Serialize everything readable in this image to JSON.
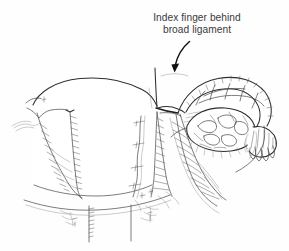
{
  "figure": {
    "title": "Index finger behind broad ligament",
    "background_color": "#fefefe",
    "ink_color": "#2e2e2e",
    "text_color": "#3b3b3b"
  },
  "callout": {
    "name": "index-finger-behind-broad-ligament",
    "line1": "Index finger behind",
    "line2": "broad ligament",
    "text_anchor_x": 197,
    "line1_y": 21,
    "line2_y": 33,
    "font_size_px": 10.2,
    "color": "#3b3b3b"
  },
  "arrow": {
    "name": "callout-arrow",
    "color": "#121212",
    "from_x": 188,
    "from_y": 41,
    "to_x": 174,
    "to_y": 70,
    "curved": true,
    "head": "filled-triangle-down"
  },
  "anatomy": {
    "labels_visible": false,
    "parts": [
      {
        "name": "uterus-body",
        "side": "center-left",
        "note": "smooth domed fundus and corpus"
      },
      {
        "name": "broad-ligament-left",
        "side": "left",
        "note": "hatched cut flap"
      },
      {
        "name": "broad-ligament-right",
        "side": "center",
        "note": "hatched cut flap with vessels"
      },
      {
        "name": "fallopian-tube",
        "side": "right",
        "note": "arching segmented tube"
      },
      {
        "name": "ovary",
        "side": "right",
        "note": "lumpy oval body"
      },
      {
        "name": "fimbriae",
        "side": "far-right",
        "note": "frilled fan at tube end"
      },
      {
        "name": "uterine-vessels",
        "side": "center",
        "note": "wavy vascular strands"
      },
      {
        "name": "cervix-vagina",
        "side": "bottom",
        "note": "two vertical walls below fornix"
      }
    ]
  }
}
